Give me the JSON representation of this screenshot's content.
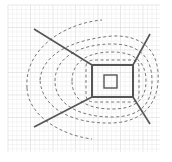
{
  "diagram": {
    "type": "field-line diagram",
    "colors": {
      "background": "#ffffff",
      "grid_minor": "#ececec",
      "grid_major": "#d8d8d8",
      "solid_line": "#555555",
      "dashed_line": "#777777"
    },
    "grid": {
      "x0": 8,
      "y0": 5,
      "x1": 160,
      "y1": 152,
      "minor_step": 4.5,
      "major_every": 5
    },
    "outer_rect": {
      "x": 92,
      "y": 65,
      "w": 41,
      "h": 32
    },
    "inner_rect": {
      "x": 104,
      "y": 75,
      "w": 13,
      "h": 13
    },
    "corner_lines": [
      {
        "name": "upper-left",
        "x1": 34,
        "y1": 29,
        "x2": 92,
        "y2": 65
      },
      {
        "name": "lower-left",
        "x1": 34,
        "y1": 127,
        "x2": 92,
        "y2": 97
      },
      {
        "name": "upper-right",
        "x1": 133,
        "y1": 65,
        "x2": 150,
        "y2": 34
      },
      {
        "name": "lower-right",
        "x1": 133,
        "y1": 97,
        "x2": 150,
        "y2": 124
      }
    ],
    "dashed_arcs": [
      {
        "d": "M 86 65 Q 88 60 94 60 L 131 60 Q 138 60 139 66 L 139 96 Q 138 102 131 102 L 94 102 Q 87 102 86 96 Z"
      },
      {
        "d": "M 72 81 C 72 60 90 52 112 52 C 135 52 146 62 146 81 C 146 100 135 109 112 109 C 90 109 72 102 72 81 Z"
      },
      {
        "d": "M 55 81 C 55 56 82 44 112 44 C 140 44 152 58 152 81 C 152 104 140 117 112 117 C 82 117 55 106 55 81 Z"
      },
      {
        "d": "M 27 88 C 24 48 66 23 102 20"
      },
      {
        "d": "M 27 88 C 28 115 60 135 92 139"
      },
      {
        "d": "M 40 80 C 42 55 70 40 112 36 C 140 35 156 48 158 72 C 160 100 146 122 112 123 C 75 124 42 110 40 80 Z"
      }
    ]
  }
}
